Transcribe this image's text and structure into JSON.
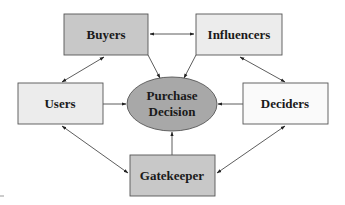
{
  "diagram": {
    "center": {
      "id": "purchase-decision",
      "label_line1": "Purchase",
      "label_line2": "Decision",
      "fill": "#a8a8a8"
    },
    "nodes": [
      {
        "id": "buyers",
        "label": "Buyers",
        "fill": "#c8c8c8"
      },
      {
        "id": "influencers",
        "label": "Influencers",
        "fill": "#ececec"
      },
      {
        "id": "users",
        "label": "Users",
        "fill": "#ececec"
      },
      {
        "id": "deciders",
        "label": "Deciders",
        "fill": "#fafafa"
      },
      {
        "id": "gatekeeper",
        "label": "Gatekeeper",
        "fill": "#c8c8c8"
      }
    ],
    "edges": [
      {
        "from": "buyers",
        "to": "influencers",
        "type": "bidirectional"
      },
      {
        "from": "buyers",
        "to": "users",
        "type": "bidirectional"
      },
      {
        "from": "influencers",
        "to": "deciders",
        "type": "bidirectional"
      },
      {
        "from": "users",
        "to": "gatekeeper",
        "type": "bidirectional"
      },
      {
        "from": "deciders",
        "to": "gatekeeper",
        "type": "bidirectional"
      },
      {
        "from": "buyers",
        "to": "purchase-decision",
        "type": "directed"
      },
      {
        "from": "influencers",
        "to": "purchase-decision",
        "type": "directed"
      },
      {
        "from": "users",
        "to": "purchase-decision",
        "type": "directed"
      },
      {
        "from": "deciders",
        "to": "purchase-decision",
        "type": "directed"
      },
      {
        "from": "gatekeeper",
        "to": "purchase-decision",
        "type": "directed"
      }
    ],
    "stroke_color": "#555555"
  }
}
